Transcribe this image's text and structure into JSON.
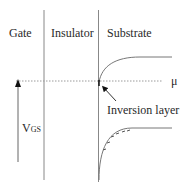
{
  "diagram": {
    "regions": [
      {
        "label": "Gate"
      },
      {
        "label": "Insulator"
      },
      {
        "label": "Substrate"
      }
    ],
    "fermi_level_label": "μ",
    "voltage_label": {
      "main": "V",
      "subscript": "GS"
    },
    "annotation": "Inversion layer",
    "charge_marks": [
      "-",
      "-",
      "-",
      "-",
      "-",
      "-"
    ],
    "colors": {
      "line": "#888888",
      "dotted": "#9a9a9a",
      "text": "#2a2a2a",
      "arrow": "#111111"
    }
  }
}
